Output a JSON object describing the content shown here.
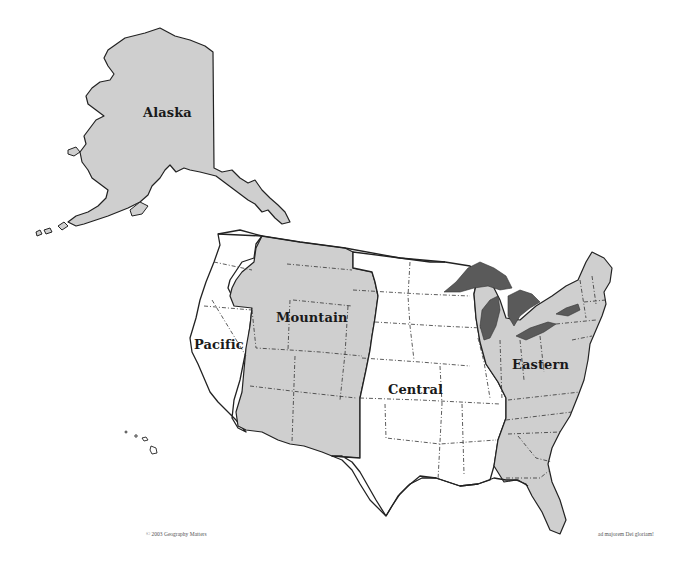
{
  "map": {
    "title": "US Time Zones",
    "colors": {
      "shaded_zone": "#cfcfcf",
      "unshaded_zone": "#ffffff",
      "great_lakes": "#5a5a5a",
      "outline": "#222222"
    },
    "zones": [
      {
        "id": "alaska",
        "label": "Alaska",
        "shaded": true
      },
      {
        "id": "pacific",
        "label": "Pacific",
        "shaded": false
      },
      {
        "id": "mountain",
        "label": "Mountain",
        "shaded": true
      },
      {
        "id": "central",
        "label": "Central",
        "shaded": false
      },
      {
        "id": "eastern",
        "label": "Eastern",
        "shaded": true
      }
    ],
    "features": {
      "great_lakes": "great-lakes",
      "hawaii": "hawaii-islands"
    }
  },
  "footer": {
    "copyright": "© 2003 Geography Matters",
    "motto": "ad majorem Dei gloriam!"
  }
}
